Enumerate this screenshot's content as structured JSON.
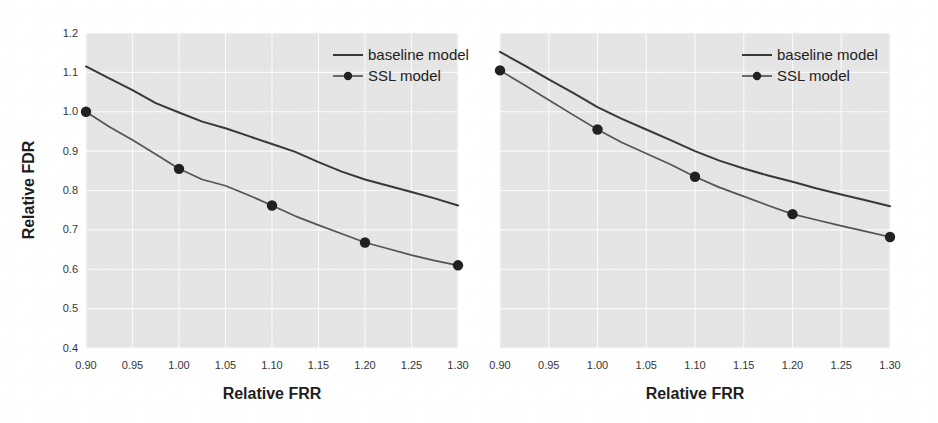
{
  "figure": {
    "background_color": "#ffffff",
    "plot_background_color": "#e3e3e3",
    "grid_color": "#fafafa",
    "panel_count": 2
  },
  "legend": {
    "baseline_label": "baseline model",
    "ssl_label": "SSL model",
    "baseline_color": "#2c2c2c",
    "ssl_color": "#4a4a4a",
    "position": "upper right"
  },
  "axes": {
    "xlabel": "Relative FRR",
    "ylabel": "Relative FDR",
    "xticks": [
      "0.90",
      "0.95",
      "1.00",
      "1.05",
      "1.10",
      "1.15",
      "1.20",
      "1.25",
      "1.30"
    ],
    "yticks": [
      "0.4",
      "0.5",
      "0.6",
      "0.7",
      "0.8",
      "0.9",
      "1.0",
      "1.1",
      "1.2"
    ],
    "xlim": [
      0.9,
      1.3
    ],
    "ylim": [
      0.4,
      1.2
    ]
  },
  "chart_data": [
    {
      "type": "line",
      "panel": "left",
      "title": "",
      "xlabel": "Relative FRR",
      "ylabel": "Relative FDR",
      "xlim": [
        0.9,
        1.3
      ],
      "ylim": [
        0.4,
        1.2
      ],
      "xticks": [
        0.9,
        0.95,
        1.0,
        1.05,
        1.1,
        1.15,
        1.2,
        1.25,
        1.3
      ],
      "yticks": [
        0.4,
        0.5,
        0.6,
        0.7,
        0.8,
        0.9,
        1.0,
        1.1,
        1.2
      ],
      "grid": true,
      "legend": [
        "baseline model",
        "SSL model"
      ],
      "legend_position": "upper right",
      "series": [
        {
          "name": "baseline model",
          "marker": "none",
          "x": [
            0.9,
            0.925,
            0.95,
            0.975,
            1.0,
            1.025,
            1.05,
            1.075,
            1.1,
            1.125,
            1.15,
            1.175,
            1.2,
            1.225,
            1.25,
            1.275,
            1.3
          ],
          "y": [
            1.115,
            1.085,
            1.055,
            1.022,
            0.998,
            0.975,
            0.958,
            0.938,
            0.918,
            0.898,
            0.872,
            0.848,
            0.828,
            0.812,
            0.796,
            0.78,
            0.762
          ]
        },
        {
          "name": "SSL model",
          "marker": "circle",
          "marker_x": [
            0.9,
            1.0,
            1.1,
            1.2,
            1.3
          ],
          "marker_y": [
            1.0,
            0.855,
            0.762,
            0.668,
            0.61
          ],
          "x": [
            0.9,
            0.925,
            0.95,
            0.975,
            1.0,
            1.025,
            1.05,
            1.075,
            1.1,
            1.125,
            1.15,
            1.175,
            1.2,
            1.225,
            1.25,
            1.275,
            1.3
          ],
          "y": [
            1.0,
            0.962,
            0.928,
            0.892,
            0.855,
            0.828,
            0.812,
            0.788,
            0.762,
            0.735,
            0.712,
            0.69,
            0.668,
            0.652,
            0.636,
            0.622,
            0.61
          ]
        }
      ]
    },
    {
      "type": "line",
      "panel": "right",
      "title": "",
      "xlabel": "Relative FRR",
      "ylabel": "",
      "xlim": [
        0.9,
        1.3
      ],
      "ylim": [
        0.4,
        1.2
      ],
      "xticks": [
        0.9,
        0.95,
        1.0,
        1.05,
        1.1,
        1.15,
        1.2,
        1.25,
        1.3
      ],
      "yticks": [],
      "grid": true,
      "legend": [
        "baseline model",
        "SSL model"
      ],
      "legend_position": "upper right",
      "series": [
        {
          "name": "baseline model",
          "marker": "none",
          "x": [
            0.9,
            0.925,
            0.95,
            0.975,
            1.0,
            1.025,
            1.05,
            1.075,
            1.1,
            1.125,
            1.15,
            1.175,
            1.2,
            1.225,
            1.25,
            1.275,
            1.3
          ],
          "y": [
            1.152,
            1.118,
            1.082,
            1.048,
            1.012,
            0.982,
            0.955,
            0.928,
            0.9,
            0.876,
            0.856,
            0.838,
            0.822,
            0.805,
            0.79,
            0.775,
            0.76
          ]
        },
        {
          "name": "SSL model",
          "marker": "circle",
          "marker_x": [
            0.9,
            1.0,
            1.1,
            1.2,
            1.3
          ],
          "marker_y": [
            1.105,
            0.955,
            0.835,
            0.74,
            0.682
          ],
          "x": [
            0.9,
            0.925,
            0.95,
            0.975,
            1.0,
            1.025,
            1.05,
            1.075,
            1.1,
            1.125,
            1.15,
            1.175,
            1.2,
            1.225,
            1.25,
            1.275,
            1.3
          ],
          "y": [
            1.105,
            1.068,
            1.03,
            0.992,
            0.955,
            0.922,
            0.894,
            0.866,
            0.835,
            0.808,
            0.785,
            0.762,
            0.74,
            0.725,
            0.71,
            0.696,
            0.682
          ]
        }
      ]
    }
  ]
}
